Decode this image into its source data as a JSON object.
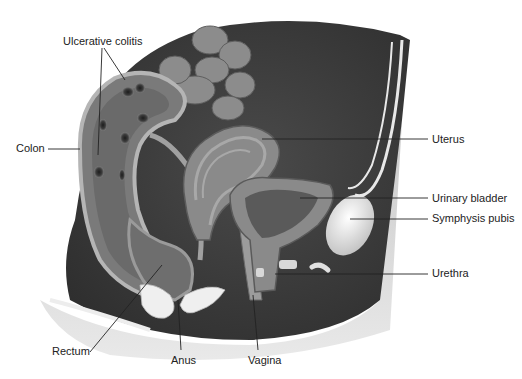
{
  "figure": {
    "type": "anatomical-illustration",
    "palette": {
      "background": "#ffffff",
      "body_dark": "#3a3a3a",
      "body_mid": "#5a5a5a",
      "tissue_light": "#9a9a9a",
      "tissue_pale": "#c8c8c8",
      "bone": "#e8e8e8",
      "skin": "#d6d6d6",
      "leader_line": "#222222",
      "label_text": "#222222"
    }
  },
  "labels": [
    {
      "id": "ulcerative-colitis",
      "text": "Ulcerative colitis",
      "x": 63,
      "y": 35
    },
    {
      "id": "colon",
      "text": "Colon",
      "x": 16,
      "y": 142
    },
    {
      "id": "uterus",
      "text": "Uterus",
      "x": 432,
      "y": 133
    },
    {
      "id": "urinary-bladder",
      "text": "Urinary bladder",
      "x": 432,
      "y": 192
    },
    {
      "id": "symphysis-pubis",
      "text": "Symphysis pubis",
      "x": 432,
      "y": 212
    },
    {
      "id": "urethra",
      "text": "Urethra",
      "x": 432,
      "y": 267
    },
    {
      "id": "rectum",
      "text": "Rectum",
      "x": 52,
      "y": 345
    },
    {
      "id": "anus",
      "text": "Anus",
      "x": 171,
      "y": 354
    },
    {
      "id": "vagina",
      "text": "Vagina",
      "x": 248,
      "y": 354
    }
  ]
}
